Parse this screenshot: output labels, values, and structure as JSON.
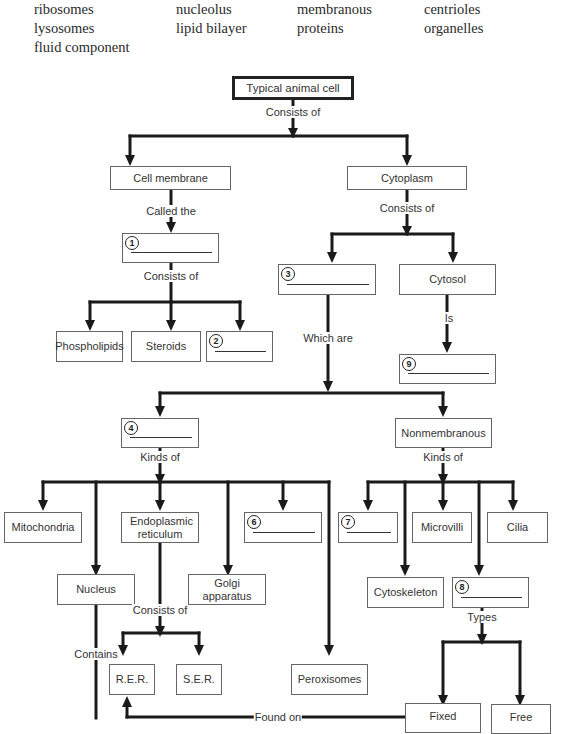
{
  "word_bank": {
    "items": [
      {
        "text": "ribosomes",
        "x": 34,
        "y": 9
      },
      {
        "text": "nucleolus",
        "x": 176,
        "y": 9
      },
      {
        "text": "membranous",
        "x": 297,
        "y": 9
      },
      {
        "text": "centrioles",
        "x": 424,
        "y": 9
      },
      {
        "text": "lysosomes",
        "x": 34,
        "y": 28
      },
      {
        "text": "lipid bilayer",
        "x": 176,
        "y": 28
      },
      {
        "text": "proteins",
        "x": 297,
        "y": 28
      },
      {
        "text": "organelles",
        "x": 424,
        "y": 28
      },
      {
        "text": "fluid component",
        "x": 34,
        "y": 47
      }
    ]
  },
  "nodes": {
    "root": {
      "label": "Typical animal cell"
    },
    "cell_membrane": {
      "label": "Cell membrane"
    },
    "cytoplasm": {
      "label": "Cytoplasm"
    },
    "blank1": {
      "number": "1",
      "label": ""
    },
    "phospholipids": {
      "label": "Phospholipids"
    },
    "steroids": {
      "label": "Steroids"
    },
    "blank2": {
      "number": "2",
      "label": ""
    },
    "blank3": {
      "number": "3",
      "label": ""
    },
    "cytosol": {
      "label": "Cytosol"
    },
    "blank9": {
      "number": "9",
      "label": ""
    },
    "blank4": {
      "number": "4",
      "label": ""
    },
    "nonmembranous": {
      "label": "Nonmembranous"
    },
    "mitochondria": {
      "label": "Mitochondria"
    },
    "endoplasmic_reticulum": {
      "label": "Endoplasmic reticulum"
    },
    "blank6": {
      "number": "6",
      "label": ""
    },
    "nucleus": {
      "label": "Nucleus"
    },
    "golgi": {
      "label": "Golgi apparatus"
    },
    "rer": {
      "label": "R.E.R."
    },
    "ser": {
      "label": "S.E.R."
    },
    "peroxisomes": {
      "label": "Peroxisomes"
    },
    "blank7": {
      "number": "7",
      "label": ""
    },
    "microvilli": {
      "label": "Microvilli"
    },
    "cilia": {
      "label": "Cilia"
    },
    "cytoskeleton": {
      "label": "Cytoskeleton"
    },
    "blank8": {
      "number": "8",
      "label": ""
    },
    "fixed": {
      "label": "Fixed"
    },
    "free": {
      "label": "Free"
    }
  },
  "connectors": {
    "root_consists_of": "Consists of",
    "membrane_called_the": "Called the",
    "blank1_consists_of": "Consists of",
    "cytoplasm_consists_of": "Consists of",
    "blank3_which_are": "Which are",
    "cytosol_is": "Is",
    "blank4_kinds_of": "Kinds of",
    "nonmembranous_kinds_of": "Kinds of",
    "er_consists_of": "Consists of",
    "nucleus_contains": "Contains",
    "blank8_types": "Types",
    "fixed_found_on": "Found on"
  },
  "colors": {
    "line": "#1a1a1a",
    "box_border": "#666666",
    "background": "#ffffff"
  }
}
